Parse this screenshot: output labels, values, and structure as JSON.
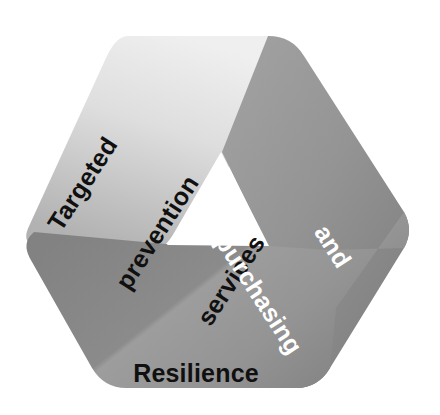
{
  "diagram": {
    "type": "triangular-cycle-ribbon",
    "title_visible": false,
    "background_color": "#ffffff",
    "segments": [
      {
        "id": "targeted-prevention-services",
        "position": "upper-left",
        "label_lines": [
          "Targeted",
          "prevention",
          "services"
        ],
        "text_color": "#101010",
        "fill_start_color": "#ececec",
        "fill_end_color": "#b8b8b8",
        "rotation_degrees": -57
      },
      {
        "id": "assessment-and-purchasing",
        "position": "right",
        "label_lines": [
          "Assessment",
          "and",
          "purchasing"
        ],
        "text_color": "#ffffff",
        "fill_start_color": "#9a9a9a",
        "fill_end_color": "#828282",
        "rotation_degrees": 57
      },
      {
        "id": "resilience",
        "position": "bottom",
        "label_lines": [
          "Resilience"
        ],
        "text_color": "#101010",
        "fill_start_color": "#888888",
        "fill_end_color": "#9c9c9c",
        "rotation_degrees": 0
      }
    ],
    "inner_cutout": {
      "shape": "triangle",
      "fill_color": "#ffffff"
    }
  }
}
